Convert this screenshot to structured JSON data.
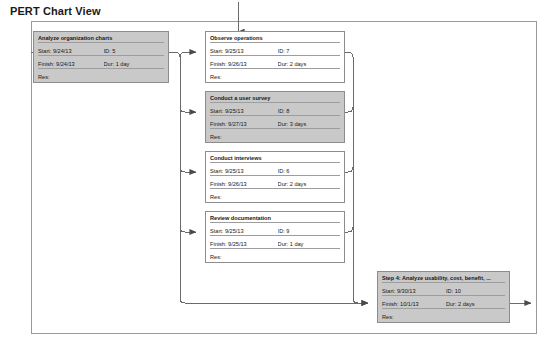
{
  "page": {
    "title": "PERT Chart View"
  },
  "labels": {
    "start": "Start:",
    "finish": "Finish:",
    "id": "ID:",
    "dur": "Dur:",
    "res": "Res:"
  },
  "nodes": [
    {
      "key": "analyze-organization-charts",
      "title": "Analyze organization charts",
      "start": "Start:  9/24/13",
      "id": "ID:   5",
      "finish": "Finish: 9/24/13",
      "dur": "Dur: 1 day",
      "res": "Res:",
      "shaded": true
    },
    {
      "key": "observe-operations",
      "title": "Observe operations",
      "start": "Start:  9/25/13",
      "id": "ID:   7",
      "finish": "Finish: 9/26/13",
      "dur": "Dur: 2 days",
      "res": "Res:",
      "shaded": false
    },
    {
      "key": "conduct-a-user-survey",
      "title": "Conduct a user survey",
      "start": "Start:  9/25/13",
      "id": "ID:   8",
      "finish": "Finish: 9/27/13",
      "dur": "Dur: 3 days",
      "res": "Res:",
      "shaded": true
    },
    {
      "key": "conduct-interviews",
      "title": "Conduct interviews",
      "start": "Start:  9/25/13",
      "id": "ID:   6",
      "finish": "Finish: 9/26/13",
      "dur": "Dur: 2 days",
      "res": "Res:",
      "shaded": false
    },
    {
      "key": "review-documentation",
      "title": "Review documentation",
      "start": "Start:  9/25/13",
      "id": "ID:   9",
      "finish": "Finish: 9/25/13",
      "dur": "Dur: 1 day",
      "res": "Res:",
      "shaded": false
    },
    {
      "key": "step-4-analyze-usability",
      "title": "Step 4: Analyze usability, cost, benefit, ...",
      "start": "Start:  9/30/13",
      "id": "ID:   10",
      "finish": "Finish: 10/1/13",
      "dur": "Dur: 2 days",
      "res": "Res:",
      "shaded": true
    }
  ],
  "colors": {
    "shaded_fill": "#c9c9c9",
    "node_border": "#8c8c8c",
    "connector": "#6b6b6b",
    "frame_border": "#9a9a9a"
  }
}
